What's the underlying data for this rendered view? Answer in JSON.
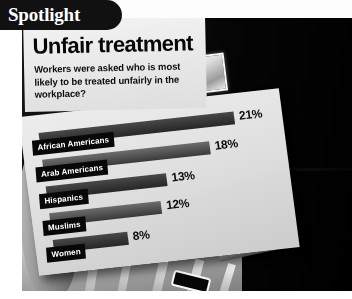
{
  "badge": {
    "label": "Spotlight",
    "icon": "spotlight-pill"
  },
  "headline": "Unfair treatment",
  "subhead": "Workers were asked who is most likely to be treated unfairly in the workplace?",
  "photo": {
    "subject": "hand holding a bar-chart board in front of an open filing cabinet",
    "elements": {
      "cabinet": "filing-cabinet",
      "label_plate": "drawer-label-plate",
      "handle": "drawer-handle",
      "folders": "file-folder-dividers",
      "hand": "hand-holding-board"
    }
  },
  "chart_data": {
    "type": "bar",
    "title": "Unfair treatment",
    "subtitle": "Workers were asked who is most likely to be treated unfairly in the workplace?",
    "orientation": "horizontal",
    "categories": [
      "African Americans",
      "Arab Americans",
      "Hispanics",
      "Muslims",
      "Women"
    ],
    "values": [
      21,
      18,
      13,
      12,
      8
    ],
    "value_labels": [
      "21%",
      "18%",
      "13%",
      "12%",
      "8%"
    ],
    "unit": "%",
    "xlabel": "",
    "ylabel": "",
    "xlim": [
      0,
      21
    ],
    "grid": false,
    "legend": "none",
    "colors": {
      "bar": "#2a2a2a",
      "label_box": "#0d0d0d",
      "board": "#dcdcdc",
      "text": "#101010"
    }
  }
}
